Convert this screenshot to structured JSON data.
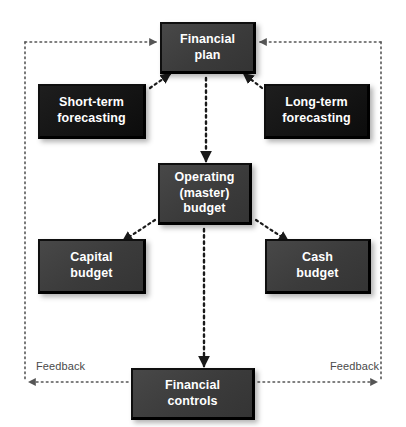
{
  "diagram": {
    "colors": {
      "box_gray": "#3f3f3f",
      "box_black": "#161616",
      "text": "#ffffff",
      "connector": "#1a1a1a",
      "frame": "#4a4a4a",
      "feedback_text": "#4a4a4a",
      "background": "#ffffff"
    },
    "nodes": [
      {
        "id": "financial-plan",
        "label": "Financial\nplan",
        "style": "gray"
      },
      {
        "id": "short-term",
        "label": "Short-term\nforecasting",
        "style": "black"
      },
      {
        "id": "long-term",
        "label": "Long-term\nforecasting",
        "style": "black"
      },
      {
        "id": "operating-budget",
        "label": "Operating\n(master)\nbudget",
        "style": "gray"
      },
      {
        "id": "capital-budget",
        "label": "Capital\nbudget",
        "style": "gray"
      },
      {
        "id": "cash-budget",
        "label": "Cash\nbudget",
        "style": "gray"
      },
      {
        "id": "financial-controls",
        "label": "Financial\ncontrols",
        "style": "gray"
      }
    ],
    "labels": {
      "feedback_left": "Feedback",
      "feedback_right": "Feedback"
    },
    "connectors": [
      {
        "from": "short-term",
        "to": "financial-plan",
        "style": "dotted",
        "arrow": "end"
      },
      {
        "from": "long-term",
        "to": "financial-plan",
        "style": "dotted",
        "arrow": "end"
      },
      {
        "from": "financial-plan",
        "to": "operating-budget",
        "style": "dotted",
        "arrow": "end"
      },
      {
        "from": "operating-budget",
        "to": "capital-budget",
        "style": "dotted",
        "arrow": "end"
      },
      {
        "from": "operating-budget",
        "to": "cash-budget",
        "style": "dotted",
        "arrow": "end"
      },
      {
        "from": "operating-budget",
        "to": "financial-controls",
        "style": "dotted",
        "arrow": "end"
      },
      {
        "from": "financial-controls",
        "to": "feedback-left-path",
        "style": "dotted",
        "arrow": "end"
      },
      {
        "from": "financial-controls",
        "to": "feedback-right-path",
        "style": "dotted",
        "arrow": "end"
      },
      {
        "from": "feedback-left-path",
        "to": "financial-plan",
        "style": "dotted",
        "arrow": "end"
      },
      {
        "from": "feedback-right-path",
        "to": "financial-plan",
        "style": "dotted",
        "arrow": "end"
      }
    ]
  }
}
